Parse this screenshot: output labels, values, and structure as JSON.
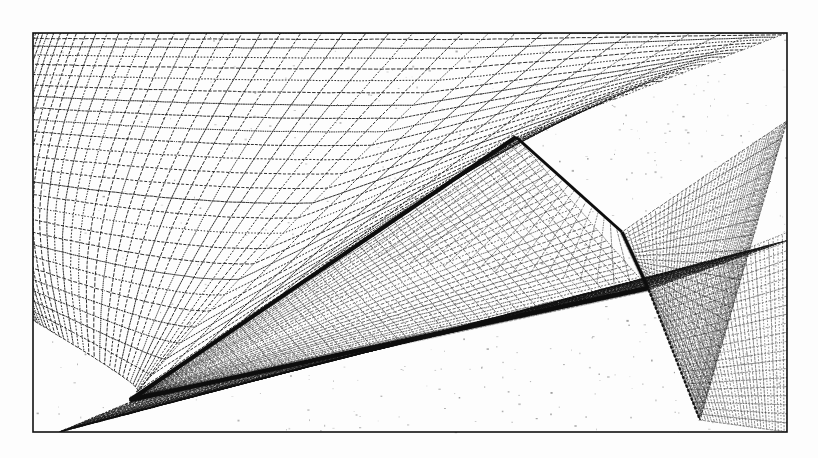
{
  "figure": {
    "kind": "scanned-cfd-mesh-figure",
    "title": "",
    "caption": "",
    "background_color": "#fdfdfd",
    "ink_color": "#111111",
    "paper_tint": "#f7f7f5",
    "frame": {
      "x": 33,
      "y": 33,
      "width": 754,
      "height": 399,
      "stroke": "#111111",
      "stroke_width": 1.6
    },
    "canvas": {
      "width": 818,
      "height": 458
    }
  },
  "chart_data": {
    "type": "diagram-mesh",
    "subtitle": "",
    "xlabel": "",
    "ylabel": "",
    "grid": true,
    "legend": [],
    "annotations": [],
    "geometry": {
      "apex": [
        130,
        400
      ],
      "root_leading_vertex": [
        516,
        137
      ],
      "root_trailing_vertex": [
        622,
        232
      ],
      "tip_trailing_vertex": [
        648,
        288
      ],
      "trailing_wake_base": [
        700,
        420
      ],
      "leading_edge_thickness": 4.2,
      "trailing_edge_thickness": 3.0
    },
    "blocks": [
      {
        "name": "upper-outer-field",
        "description": "Coarse O-type mesh above the wing, clustering toward the right wall",
        "i_lines": 42,
        "j_lines": 26,
        "clustering": "right"
      },
      {
        "name": "wing-upper-surface",
        "description": "Dense surface mesh on the wing upper side",
        "i_lines": 60,
        "j_lines": 34,
        "clustering": "leading-edge"
      },
      {
        "name": "lower-outer-field",
        "description": "Grid plane beneath the wing leading edge",
        "i_lines": 46,
        "j_lines": 30,
        "clustering": "center"
      },
      {
        "name": "wake-plane",
        "description": "Streamwise wake sheet aft of the trailing edge",
        "i_lines": 50,
        "j_lines": 22,
        "clustering": "trailing-edge"
      }
    ],
    "axis_ranges": {
      "x": [
        0,
        818
      ],
      "y": [
        0,
        458
      ]
    }
  }
}
